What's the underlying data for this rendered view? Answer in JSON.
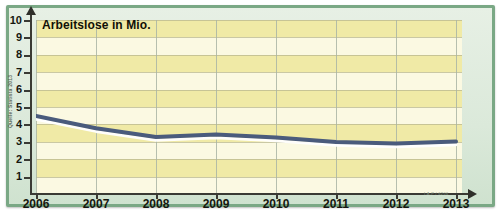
{
  "chart_data": {
    "type": "line",
    "title": "Arbeitslose in Mio.",
    "xlabel": "",
    "ylabel": "Arbeitslose in Mio.",
    "x": [
      2006,
      2007,
      2008,
      2009,
      2010,
      2011,
      2012,
      2013
    ],
    "categories": [
      "2006",
      "2007",
      "2008",
      "2009",
      "2010",
      "2011",
      "2012",
      "2013"
    ],
    "values": [
      4.49,
      3.78,
      3.27,
      3.42,
      3.24,
      2.98,
      2.9,
      3.02
    ],
    "series": [
      {
        "name": "Arbeitslose in Mio.",
        "values": [
          4.49,
          3.78,
          3.27,
          3.42,
          3.24,
          2.98,
          2.9,
          3.02
        ]
      }
    ],
    "ylim": [
      0,
      10
    ],
    "xlim": [
      2006,
      2013
    ],
    "yticks": [
      1,
      2,
      3,
      4,
      5,
      6,
      7,
      8,
      9,
      10
    ],
    "ytick_labels": [
      "1",
      "2",
      "3",
      "4",
      "5",
      "6",
      "7",
      "8",
      "9",
      "10"
    ],
    "xtick_labels": [
      "2006",
      "2007",
      "2008",
      "2009",
      "2010",
      "2011",
      "2012",
      "2013"
    ],
    "grid": true,
    "legend": false,
    "line_color": "#4a5b7c",
    "band_color_light": "#fbf9e2",
    "band_color_dark": "#f0eaa6",
    "frame_color": "#7aa885"
  },
  "source": {
    "note": "Quelle: Statista 2013",
    "credit": "I.A.P / 6206"
  },
  "axis": {
    "y_arrow_icon": "arrow-up-icon",
    "x_arrow_icon": "arrow-right-icon"
  }
}
